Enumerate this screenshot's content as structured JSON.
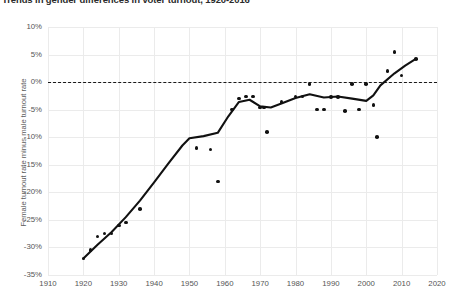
{
  "chart_data": {
    "type": "scatter",
    "title": "Trends in gender differences in voter turnout, 1920-2016",
    "xlabel": "",
    "ylabel": "Female turnout rate minus male turnout rate",
    "xlim": [
      1910,
      2020
    ],
    "ylim": [
      -35,
      10
    ],
    "grid": true,
    "legend": false,
    "x_ticks": [
      "1910",
      "1920",
      "1930",
      "1940",
      "1950",
      "1960",
      "1970",
      "1980",
      "1990",
      "2000",
      "2010",
      "2020"
    ],
    "y_ticks": [
      "10%",
      "5%",
      "0%",
      "-5%",
      "-10%",
      "-15%",
      "-20%",
      "-25%",
      "-30%",
      "-35%"
    ],
    "y_tick_values": [
      10,
      5,
      0,
      -5,
      -10,
      -15,
      -20,
      -25,
      -30,
      -35
    ],
    "reference_line": {
      "value": 0,
      "style": "dashed",
      "color": "#1a1a1a"
    },
    "points": [
      {
        "x": 1920,
        "y": -32.0
      },
      {
        "x": 1922,
        "y": -30.5
      },
      {
        "x": 1924,
        "y": -28.0
      },
      {
        "x": 1926,
        "y": -27.5
      },
      {
        "x": 1928,
        "y": -27.5
      },
      {
        "x": 1930,
        "y": -26.0
      },
      {
        "x": 1932,
        "y": -25.5
      },
      {
        "x": 1936,
        "y": -23.0
      },
      {
        "x": 1952,
        "y": -12.0
      },
      {
        "x": 1956,
        "y": -12.2
      },
      {
        "x": 1958,
        "y": -18.0
      },
      {
        "x": 1962,
        "y": -5.0
      },
      {
        "x": 1964,
        "y": -3.0
      },
      {
        "x": 1966,
        "y": -2.6
      },
      {
        "x": 1968,
        "y": -2.6
      },
      {
        "x": 1970,
        "y": -4.6
      },
      {
        "x": 1971,
        "y": -4.6
      },
      {
        "x": 1972,
        "y": -9.0
      },
      {
        "x": 1976,
        "y": -3.6
      },
      {
        "x": 1980,
        "y": -2.6
      },
      {
        "x": 1982,
        "y": -2.6
      },
      {
        "x": 1984,
        "y": -0.3
      },
      {
        "x": 1986,
        "y": -5.0
      },
      {
        "x": 1988,
        "y": -5.0
      },
      {
        "x": 1990,
        "y": -2.7
      },
      {
        "x": 1992,
        "y": -2.7
      },
      {
        "x": 1994,
        "y": -5.2
      },
      {
        "x": 1996,
        "y": -0.3
      },
      {
        "x": 1998,
        "y": -5.0
      },
      {
        "x": 2000,
        "y": -0.3
      },
      {
        "x": 2002,
        "y": -4.2
      },
      {
        "x": 2003,
        "y": -10.0
      },
      {
        "x": 2006,
        "y": 2.0
      },
      {
        "x": 2008,
        "y": 5.5
      },
      {
        "x": 2010,
        "y": 1.2
      },
      {
        "x": 2014,
        "y": 4.2
      }
    ],
    "trend_line": [
      {
        "x": 1920,
        "y": -32.0
      },
      {
        "x": 1924,
        "y": -29.5
      },
      {
        "x": 1928,
        "y": -27.2
      },
      {
        "x": 1932,
        "y": -24.5
      },
      {
        "x": 1936,
        "y": -21.5
      },
      {
        "x": 1940,
        "y": -18.2
      },
      {
        "x": 1944,
        "y": -14.8
      },
      {
        "x": 1948,
        "y": -11.5
      },
      {
        "x": 1950,
        "y": -10.2
      },
      {
        "x": 1954,
        "y": -9.8
      },
      {
        "x": 1958,
        "y": -9.2
      },
      {
        "x": 1961,
        "y": -6.2
      },
      {
        "x": 1964,
        "y": -3.6
      },
      {
        "x": 1967,
        "y": -3.2
      },
      {
        "x": 1970,
        "y": -4.4
      },
      {
        "x": 1973,
        "y": -4.6
      },
      {
        "x": 1976,
        "y": -3.9
      },
      {
        "x": 1980,
        "y": -2.9
      },
      {
        "x": 1984,
        "y": -2.2
      },
      {
        "x": 1988,
        "y": -2.8
      },
      {
        "x": 1992,
        "y": -2.6
      },
      {
        "x": 1996,
        "y": -3.0
      },
      {
        "x": 2000,
        "y": -3.4
      },
      {
        "x": 2002,
        "y": -2.4
      },
      {
        "x": 2004,
        "y": -0.6
      },
      {
        "x": 2008,
        "y": 1.6
      },
      {
        "x": 2011,
        "y": 3.0
      },
      {
        "x": 2014,
        "y": 4.2
      }
    ]
  }
}
